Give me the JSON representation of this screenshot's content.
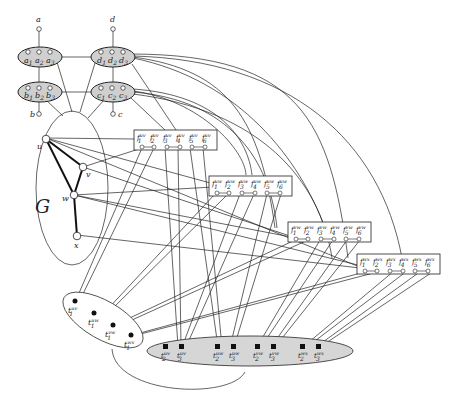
{
  "colors": {
    "stroke": "#222222",
    "cluster_fill": "#cfcfcf",
    "terminal_ellipse_fill": "#d6d6d6",
    "background": "#ffffff"
  },
  "terminals_top": {
    "a": "a",
    "d": "d",
    "b": "b",
    "c": "c"
  },
  "clusters": [
    {
      "id": "A",
      "labels": [
        "a1",
        "a2",
        "a3"
      ],
      "display": [
        "a",
        "a",
        "a"
      ],
      "subs": [
        "1",
        "2",
        "3"
      ]
    },
    {
      "id": "D",
      "labels": [
        "d1",
        "d2",
        "d3"
      ],
      "display": [
        "d",
        "d",
        "d"
      ],
      "subs": [
        "1",
        "2",
        "3"
      ]
    },
    {
      "id": "B",
      "labels": [
        "b1",
        "b2",
        "b3"
      ],
      "display": [
        "b",
        "b",
        "b"
      ],
      "subs": [
        "1",
        "2",
        "3"
      ]
    },
    {
      "id": "C",
      "labels": [
        "c1",
        "c2",
        "c3"
      ],
      "display": [
        "c",
        "c",
        "c"
      ],
      "subs": [
        "1",
        "2",
        "3"
      ]
    }
  ],
  "graph": {
    "label": "G",
    "vertices": [
      "u",
      "v",
      "w",
      "x"
    ],
    "edges": [
      [
        "u",
        "v"
      ],
      [
        "u",
        "w"
      ],
      [
        "v",
        "w"
      ],
      [
        "w",
        "x"
      ]
    ]
  },
  "edge_gadgets": [
    {
      "edge": "uv",
      "sup": "uv",
      "items": [
        "1",
        "2",
        "3",
        "4",
        "5",
        "6"
      ]
    },
    {
      "edge": "uw",
      "sup": "uw",
      "items": [
        "1",
        "2",
        "3",
        "4",
        "5",
        "6"
      ]
    },
    {
      "edge": "vw",
      "sup": "vw",
      "items": [
        "1",
        "2",
        "3",
        "4",
        "5",
        "6"
      ]
    },
    {
      "edge": "wx",
      "sup": "wx",
      "items": [
        "1",
        "2",
        "3",
        "4",
        "5",
        "6"
      ]
    }
  ],
  "gadget_prefix": "f",
  "t_left": [
    {
      "label": "t",
      "sub": "1",
      "sup": "uv"
    },
    {
      "label": "t",
      "sub": "1",
      "sup": "uw"
    },
    {
      "label": "t",
      "sub": "1",
      "sup": "vw"
    },
    {
      "label": "t",
      "sub": "1",
      "sup": "wx"
    }
  ],
  "t_right": [
    {
      "label": "t",
      "sub": "2",
      "sup": "uv"
    },
    {
      "label": "t",
      "sub": "3",
      "sup": "uv"
    },
    {
      "label": "t",
      "sub": "2",
      "sup": "uw"
    },
    {
      "label": "t",
      "sub": "3",
      "sup": "uw"
    },
    {
      "label": "t",
      "sub": "2",
      "sup": "vw"
    },
    {
      "label": "t",
      "sub": "3",
      "sup": "vw"
    },
    {
      "label": "t",
      "sub": "2",
      "sup": "wx"
    },
    {
      "label": "t",
      "sub": "3",
      "sup": "wx"
    }
  ]
}
